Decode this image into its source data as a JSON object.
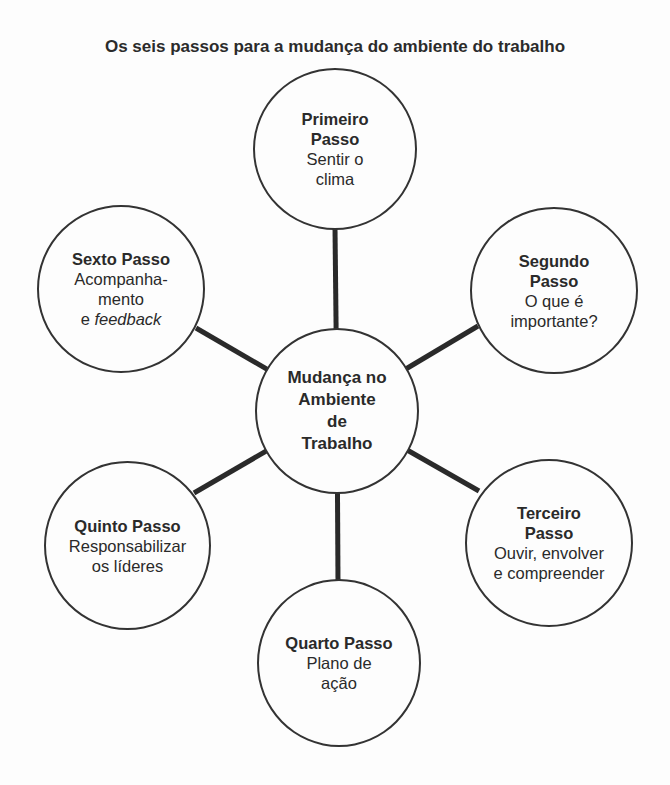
{
  "title": "Os seis passos para a mudança do ambiente do trabalho",
  "center": {
    "lines": [
      "Mudança no",
      "Ambiente",
      "de",
      "Trabalho"
    ]
  },
  "steps": [
    {
      "heading_lines": [
        "Primeiro",
        "Passo"
      ],
      "body_lines": [
        "Sentir o",
        "clima"
      ]
    },
    {
      "heading_lines": [
        "Segundo",
        "Passo"
      ],
      "body_lines": [
        "O que é",
        "importante?"
      ]
    },
    {
      "heading_lines": [
        "Terceiro",
        "Passo"
      ],
      "body_lines": [
        "Ouvir, envolver",
        "e compreender"
      ]
    },
    {
      "heading_lines": [
        "Quarto Passo"
      ],
      "body_lines": [
        "Plano de",
        "ação"
      ]
    },
    {
      "heading_lines": [
        "Quinto Passo"
      ],
      "body_lines": [
        "Responsabilizar",
        "os líderes"
      ]
    },
    {
      "heading_lines": [
        "Sexto Passo"
      ],
      "body_lines": [
        "Acompanha-",
        "mento"
      ],
      "body_last_prefix": "e ",
      "body_last_italic": "feedback"
    }
  ],
  "colors": {
    "stroke": "#333333",
    "connector": "#2a2a2a",
    "text": "#2a2a2a",
    "background": "#fdfdfd"
  }
}
